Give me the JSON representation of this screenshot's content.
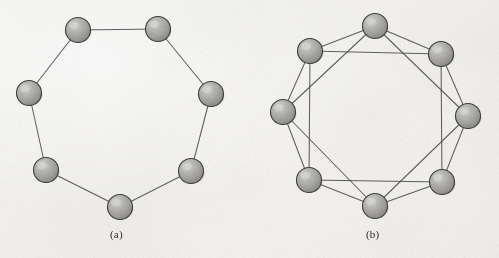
{
  "figure": {
    "kind": "graph-diagram-pair",
    "background_color": "#f4f3f0",
    "edge_color": "#4a4a4a",
    "node_fill": "#9d9d9d",
    "node_outline": "#3c3c3c",
    "node_radius": 12.5
  },
  "panels": [
    {
      "id": "panel-a",
      "caption": "(a)",
      "caption_x": 110,
      "caption_y": 228,
      "description": "ring of eight nodes, each joined to its two immediate neighbours",
      "node_count": 8,
      "degree": 2,
      "nodes": [
        {
          "id": "a0",
          "label": "",
          "cx": 158,
          "cy": 29
        },
        {
          "id": "a1",
          "label": "",
          "cx": 211,
          "cy": 94
        },
        {
          "id": "a2",
          "label": "",
          "cx": 191,
          "cy": 171
        },
        {
          "id": "a3",
          "label": "",
          "cx": 120,
          "cy": 207
        },
        {
          "id": "a4",
          "label": "",
          "cx": 46,
          "cy": 170
        },
        {
          "id": "a5",
          "label": "",
          "cx": 29,
          "cy": 93
        },
        {
          "id": "a6",
          "label": "",
          "cx": 78,
          "cy": 30
        },
        {
          "id": "a7",
          "label": "",
          "cx": 158,
          "cy": 29
        }
      ],
      "edges": [
        [
          0,
          1
        ],
        [
          1,
          2
        ],
        [
          2,
          3
        ],
        [
          3,
          4
        ],
        [
          4,
          5
        ],
        [
          5,
          6
        ],
        [
          6,
          0
        ]
      ]
    },
    {
      "id": "panel-b",
      "caption": "(b)",
      "caption_x": 366,
      "caption_y": 228,
      "description": "ring lattice of eight nodes, each joined to its four nearest neighbours",
      "node_count": 8,
      "degree": 4,
      "nodes": [
        {
          "id": "b0",
          "label": "",
          "cx": 375,
          "cy": 26
        },
        {
          "id": "b1",
          "label": "",
          "cx": 441,
          "cy": 54
        },
        {
          "id": "b2",
          "label": "",
          "cx": 468,
          "cy": 116
        },
        {
          "id": "b3",
          "label": "",
          "cx": 442,
          "cy": 182
        },
        {
          "id": "b4",
          "label": "",
          "cx": 375,
          "cy": 206
        },
        {
          "id": "b5",
          "label": "",
          "cx": 309,
          "cy": 180
        },
        {
          "id": "b6",
          "label": "",
          "cx": 283,
          "cy": 112
        },
        {
          "id": "b7",
          "label": "",
          "cx": 310,
          "cy": 51
        }
      ],
      "edges": [
        [
          0,
          1
        ],
        [
          1,
          2
        ],
        [
          2,
          3
        ],
        [
          3,
          4
        ],
        [
          4,
          5
        ],
        [
          5,
          6
        ],
        [
          6,
          7
        ],
        [
          7,
          0
        ],
        [
          0,
          2
        ],
        [
          1,
          3
        ],
        [
          2,
          4
        ],
        [
          3,
          5
        ],
        [
          4,
          6
        ],
        [
          5,
          7
        ],
        [
          6,
          0
        ],
        [
          7,
          1
        ]
      ]
    }
  ]
}
